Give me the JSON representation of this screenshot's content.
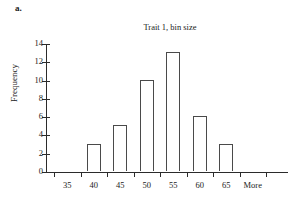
{
  "panel": {
    "label": "a."
  },
  "chart_data": {
    "type": "bar",
    "title": "Trait 1, bin size",
    "xlabel": "",
    "ylabel": "Frequency",
    "categories": [
      "35",
      "40",
      "45",
      "50",
      "55",
      "60",
      "65",
      "More"
    ],
    "values": [
      0,
      3,
      5,
      10,
      13,
      6,
      3,
      0
    ],
    "ylim": [
      0,
      14
    ],
    "yticks": [
      0,
      2,
      4,
      6,
      8,
      10,
      12,
      14
    ],
    "ytick_labels": [
      "0",
      "2",
      "4",
      "6",
      "8",
      "10",
      "12",
      "14"
    ],
    "grid": false,
    "legend": null,
    "series": [
      {
        "name": "Frequency",
        "values": [
          0,
          3,
          5,
          10,
          13,
          6,
          3,
          0
        ]
      }
    ],
    "bar_style": {
      "fill": "#ffffff",
      "edge": "#4a4a4a"
    },
    "axis_color": "#2b2b2b"
  }
}
